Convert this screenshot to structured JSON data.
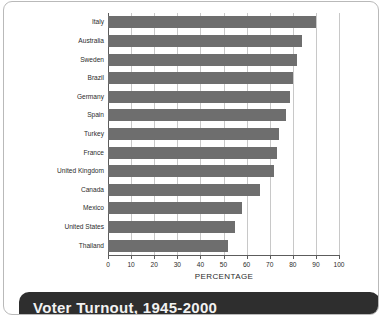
{
  "banner": {
    "title": "Voter Turnout, 1945-2000"
  },
  "chart_data": {
    "type": "bar",
    "orientation": "horizontal",
    "title": "",
    "xlabel": "PERCENTAGE",
    "ylabel": "",
    "xlim": [
      0,
      100
    ],
    "xticks": [
      0,
      10,
      20,
      30,
      40,
      50,
      60,
      70,
      80,
      90,
      100
    ],
    "grid": true,
    "legend": false,
    "bar_color": "#6e6e6e",
    "categories": [
      "Italy",
      "Australia",
      "Sweden",
      "Brazil",
      "Germany",
      "Spain",
      "Turkey",
      "France",
      "United Kingdom",
      "Canada",
      "Mexico",
      "United States",
      "Thailand"
    ],
    "values": [
      90,
      84,
      82,
      80,
      79,
      77,
      74,
      73,
      72,
      66,
      58,
      55,
      52
    ]
  }
}
